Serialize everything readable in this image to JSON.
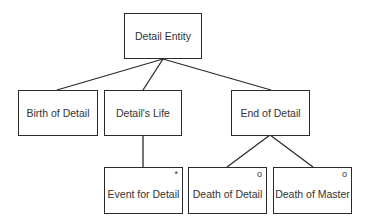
{
  "diagram": {
    "type": "jackson-structure-diagram",
    "root": {
      "label": "Detail Entity"
    },
    "level1": [
      {
        "label": "Birth of Detail",
        "marker": ""
      },
      {
        "label": "Detail's Life",
        "marker": ""
      },
      {
        "label": "End of Detail",
        "marker": ""
      }
    ],
    "level2": [
      {
        "label": "Event for Detail",
        "marker": "*",
        "parent": "Detail's Life"
      },
      {
        "label": "Death of Detail",
        "marker": "o",
        "parent": "End of Detail"
      },
      {
        "label": "Death of Master",
        "marker": "o",
        "parent": "End of Detail"
      }
    ],
    "colors": {
      "line": "#2a2a2a",
      "text": "#333333",
      "background": "#ffffff"
    }
  }
}
